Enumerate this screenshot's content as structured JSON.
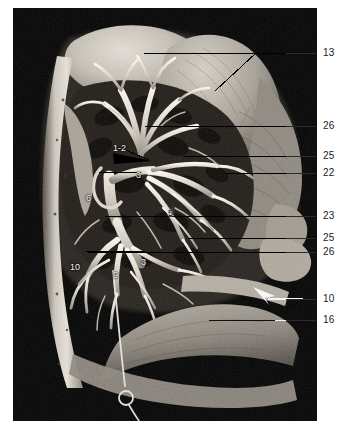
{
  "figure": {
    "kind": "anatomical-dissection-photograph",
    "plate_background": "#000000",
    "page_background": "#ffffff",
    "label_color": "#1a1a1a",
    "leader_color": "#2b2b2b",
    "arrow_color": "#ffffff"
  },
  "index_labels": [
    {
      "text": "13",
      "x": 323,
      "y": 48
    },
    {
      "text": "26",
      "x": 323,
      "y": 121
    },
    {
      "text": "25",
      "x": 323,
      "y": 151
    },
    {
      "text": "22",
      "x": 323,
      "y": 168
    },
    {
      "text": "23",
      "x": 323,
      "y": 211
    },
    {
      "text": "25",
      "x": 323,
      "y": 233
    },
    {
      "text": "26",
      "x": 323,
      "y": 247
    },
    {
      "text": "10",
      "x": 323,
      "y": 294
    },
    {
      "text": "16",
      "x": 323,
      "y": 315
    }
  ],
  "outer_leaders": [
    {
      "for": "13",
      "left": 286,
      "top": 53,
      "width": 30
    },
    {
      "for": "26",
      "left": 286,
      "top": 126,
      "width": 30
    },
    {
      "for": "25",
      "left": 286,
      "top": 156,
      "width": 30
    },
    {
      "for": "22",
      "left": 286,
      "top": 173,
      "width": 30
    },
    {
      "for": "23",
      "left": 286,
      "top": 216,
      "width": 30
    },
    {
      "for": "25",
      "left": 286,
      "top": 238,
      "width": 30
    },
    {
      "for": "26",
      "left": 286,
      "top": 252,
      "width": 30
    },
    {
      "for": "10",
      "left": 286,
      "top": 299,
      "width": 30
    },
    {
      "for": "16",
      "left": 286,
      "top": 320,
      "width": 30
    }
  ],
  "photo_labels": [
    {
      "text": "1-2",
      "x": 113,
      "y": 141,
      "tone": "light"
    },
    {
      "text": "3",
      "x": 136,
      "y": 168,
      "tone": "light"
    },
    {
      "text": "6",
      "x": 86,
      "y": 191,
      "tone": "light"
    },
    {
      "text": "5",
      "x": 168,
      "y": 206,
      "tone": "dark"
    },
    {
      "text": "3",
      "x": 141,
      "y": 255,
      "tone": "light"
    },
    {
      "text": "10",
      "x": 70,
      "y": 260,
      "tone": "light"
    },
    {
      "text": "9",
      "x": 113,
      "y": 268,
      "tone": "light"
    }
  ],
  "structures_keyed": {
    "1-2": "apical / posterior segmental bronchus",
    "3": "anterior segmental bronchus",
    "5": "segmental bronchus",
    "6": "superior segmental bronchus",
    "9": "lateral basal segmental bronchus",
    "10": "posterior basal segmental bronchus",
    "13": "structure 13",
    "16": "structure 16",
    "22": "structure 22",
    "23": "structure 23",
    "25": "structure 25",
    "26": "structure 26"
  }
}
